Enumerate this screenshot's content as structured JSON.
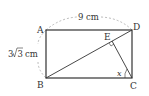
{
  "diagram": {
    "points": {
      "A": {
        "label": "A",
        "x": 46,
        "y": 30
      },
      "B": {
        "label": "B",
        "x": 46,
        "y": 78
      },
      "C": {
        "label": "C",
        "x": 132,
        "y": 78
      },
      "D": {
        "label": "D",
        "x": 132,
        "y": 30
      },
      "E": {
        "label": "E",
        "x": 112,
        "y": 40
      }
    },
    "top_length": "9 cm",
    "side_length_coef": "3",
    "side_length_rad": "3",
    "side_length_unit": "cm",
    "angle_label": "x",
    "colors": {
      "stroke": "#333333",
      "dashed": "#aaaaaa"
    }
  }
}
